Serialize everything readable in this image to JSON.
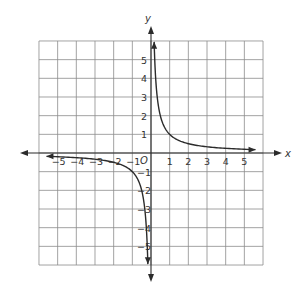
{
  "chart_data": {
    "type": "line",
    "title": "",
    "xlabel": "x",
    "ylabel": "y",
    "origin_label": "O",
    "xlim": [
      -6,
      6
    ],
    "ylim": [
      -6,
      6
    ],
    "grid": true,
    "x_ticks": [
      "-5",
      "-4",
      "-3",
      "-2",
      "-1",
      "1",
      "2",
      "3",
      "4",
      "5"
    ],
    "y_ticks": [
      "5",
      "4",
      "3",
      "2",
      "1",
      "-1",
      "-2",
      "-3",
      "-4",
      "-5"
    ],
    "function": "y = 1/x",
    "series": [
      {
        "name": "branch-positive",
        "x": [
          0.17,
          0.2,
          0.25,
          0.33,
          0.5,
          1,
          2,
          3,
          4,
          5,
          6
        ],
        "y": [
          6,
          5,
          4,
          3,
          2,
          1,
          0.5,
          0.33,
          0.25,
          0.2,
          0.17
        ]
      },
      {
        "name": "branch-negative",
        "x": [
          -5.6,
          -5,
          -4,
          -3,
          -2,
          -1,
          -0.5,
          -0.33,
          -0.25,
          -0.2,
          -0.17
        ],
        "y": [
          -0.18,
          -0.2,
          -0.25,
          -0.33,
          -0.5,
          -1,
          -2,
          -3,
          -4,
          -5,
          -6
        ]
      }
    ]
  }
}
